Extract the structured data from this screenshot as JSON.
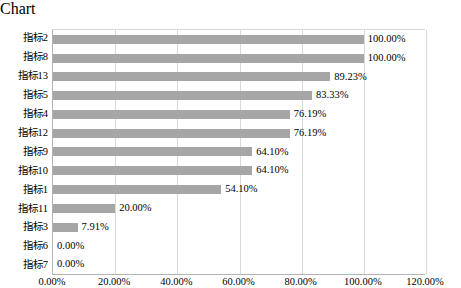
{
  "chart_data": {
    "type": "bar",
    "orientation": "horizontal",
    "title": "",
    "subtitle": "",
    "xlabel": "",
    "ylabel": "",
    "xlim": [
      0,
      120
    ],
    "grid": true,
    "legend": false,
    "bar_color": "#A6A6A6",
    "gridline_color": "#D9D9D9",
    "axis_color": "#B4B4B4",
    "value_label_format": "0.00%",
    "xticks": [
      0,
      20,
      40,
      60,
      80,
      100,
      120
    ],
    "xtick_labels": [
      "0.00%",
      "20.00%",
      "40.00%",
      "60.00%",
      "80.00%",
      "100.00%",
      "120.00%"
    ],
    "categories": [
      "指标2",
      "指标8",
      "指标13",
      "指标5",
      "指标4",
      "指标12",
      "指标9",
      "指标10",
      "指标1",
      "指标11",
      "指标3",
      "指标6",
      "指标7"
    ],
    "values": [
      100.0,
      100.0,
      89.23,
      83.33,
      76.19,
      76.19,
      64.1,
      64.1,
      54.1,
      20.0,
      7.91,
      0.0,
      0.0
    ],
    "value_labels": [
      "100.00%",
      "100.00%",
      "89.23%",
      "83.33%",
      "76.19%",
      "76.19%",
      "64.10%",
      "64.10%",
      "54.10%",
      "20.00%",
      "7.91%",
      "0.00%",
      "0.00%"
    ],
    "bars": [
      {
        "category": "指标2",
        "value": 100.0,
        "label": "100.00%"
      },
      {
        "category": "指标8",
        "value": 100.0,
        "label": "100.00%"
      },
      {
        "category": "指标13",
        "value": 89.23,
        "label": "89.23%"
      },
      {
        "category": "指标5",
        "value": 83.33,
        "label": "83.33%"
      },
      {
        "category": "指标4",
        "value": 76.19,
        "label": "76.19%"
      },
      {
        "category": "指标12",
        "value": 76.19,
        "label": "76.19%"
      },
      {
        "category": "指标9",
        "value": 64.1,
        "label": "64.10%"
      },
      {
        "category": "指标10",
        "value": 64.1,
        "label": "64.10%"
      },
      {
        "category": "指标1",
        "value": 54.1,
        "label": "54.10%"
      },
      {
        "category": "指标11",
        "value": 20.0,
        "label": "20.00%"
      },
      {
        "category": "指标3",
        "value": 7.91,
        "label": "7.91%"
      },
      {
        "category": "指标6",
        "value": 0.0,
        "label": "0.00%"
      },
      {
        "category": "指标7",
        "value": 0.0,
        "label": "0.00%"
      }
    ]
  }
}
